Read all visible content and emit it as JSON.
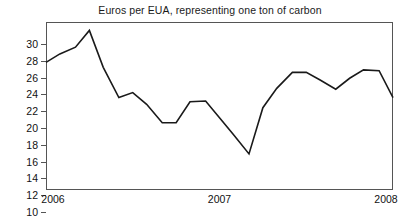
{
  "chart_data": {
    "type": "line",
    "title": "Euros per EUA, representing one ton of carbon",
    "xlabel": "",
    "ylabel": "",
    "ylim": [
      10,
      30
    ],
    "ytick_values": [
      10,
      12,
      14,
      16,
      18,
      20,
      22,
      24,
      26,
      28,
      30
    ],
    "ytick_labels": [
      "10",
      "12",
      "14",
      "16",
      "18",
      "20",
      "22",
      "24",
      "26",
      "28",
      "30"
    ],
    "xtick_values": [
      2006,
      2007,
      2008
    ],
    "xtick_labels": [
      "2006",
      "2007",
      "2008"
    ],
    "xlim": [
      2006,
      2008
    ],
    "grid": "horizontal",
    "legend": "none",
    "line_color": "#1a1a1a",
    "grid_color": "#9a9a9a",
    "axis_color": "#555555",
    "background_color": "#ffffff",
    "series": [
      {
        "name": "Euros per EUA",
        "x": [
          2006.0,
          2006.08,
          2006.17,
          2006.25,
          2006.33,
          2006.42,
          2006.5,
          2006.58,
          2006.67,
          2006.75,
          2006.83,
          2006.92,
          2007.0,
          2007.08,
          2007.17,
          2007.25,
          2007.33,
          2007.42,
          2007.5,
          2007.58,
          2007.67,
          2007.75,
          2007.83,
          2007.92,
          2008.0
        ],
        "values": [
          25.2,
          26.2,
          27.0,
          29.0,
          24.6,
          21.0,
          21.6,
          20.2,
          18.0,
          18.0,
          20.5,
          20.6,
          18.6,
          16.6,
          14.3,
          19.8,
          22.1,
          24.0,
          24.0,
          23.1,
          22.0,
          23.3,
          24.3,
          24.2,
          21.0
        ]
      }
    ]
  }
}
